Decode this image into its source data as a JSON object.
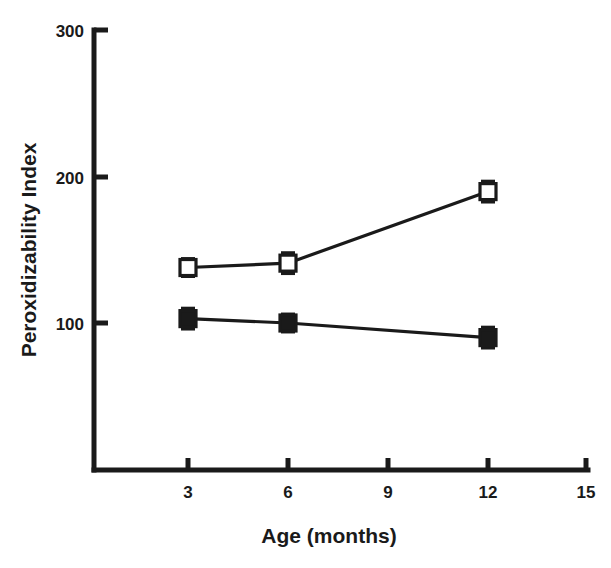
{
  "chart_data": {
    "type": "line",
    "title": "",
    "xlabel": "Age (months)",
    "ylabel": "Peroxidizability Index",
    "xlim": [
      0,
      15
    ],
    "ylim": [
      0,
      300
    ],
    "xticks": [
      3,
      6,
      9,
      12,
      15
    ],
    "xtick_labels": [
      "3",
      "6",
      "9",
      "12",
      "15"
    ],
    "yticks": [
      100,
      200,
      300
    ],
    "ytick_labels": [
      "100",
      "200",
      "300"
    ],
    "grid": false,
    "legend": "none",
    "x": [
      3,
      6,
      12
    ],
    "series": [
      {
        "name": "open-square-series",
        "marker": "open-square",
        "values": [
          138,
          141,
          190
        ],
        "errors": [
          6,
          7,
          7
        ]
      },
      {
        "name": "filled-square-series",
        "marker": "filled-square",
        "values": [
          103,
          100,
          90
        ],
        "errors": [
          7,
          6,
          7
        ]
      }
    ]
  },
  "axes": {
    "x_title": "Age (months)",
    "y_title": "Peroxidizability Index"
  }
}
